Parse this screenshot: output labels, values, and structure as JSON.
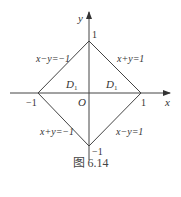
{
  "figure": {
    "caption": "图 6.14",
    "axes": {
      "x_label": "x",
      "y_label": "y",
      "origin_label": "O"
    },
    "ticks": {
      "x_pos": "1",
      "x_neg": "−1",
      "y_pos": "1",
      "y_neg": "−1"
    },
    "lines": {
      "upper_left": "x−y=−1",
      "upper_right": "x+y=1",
      "lower_left": "x+y=−1",
      "lower_right": "x−y=1"
    },
    "regions": {
      "left": "D",
      "left_sub": "1",
      "right": "D",
      "right_sub": "1"
    }
  }
}
